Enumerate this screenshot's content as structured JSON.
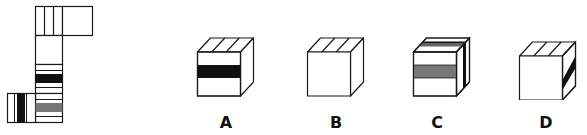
{
  "puzzle": {
    "type": "cube-net-folding",
    "net": {
      "faces": [
        {
          "id": "top-left",
          "pattern": "three-vertical-stripes"
        },
        {
          "id": "top-right",
          "pattern": "blank"
        },
        {
          "id": "middle-1",
          "pattern": "blank"
        },
        {
          "id": "middle-2",
          "pattern": "black-horizontal-band"
        },
        {
          "id": "bottom",
          "pattern": "gray-horizontal-band"
        },
        {
          "id": "bottom-left",
          "pattern": "black-vertical-band"
        }
      ]
    },
    "options": [
      {
        "label": "A",
        "front": "black-horizontal-band",
        "top": "three-stripes",
        "right": "blank"
      },
      {
        "label": "B",
        "front": "blank",
        "top": "three-stripes",
        "right": "blank"
      },
      {
        "label": "C",
        "front": "gray-horizontal-band",
        "top": "black-and-gray-stripes",
        "right": "black-vertical-band"
      },
      {
        "label": "D",
        "front": "blank",
        "top": "three-stripes",
        "right": "black-diagonal-band"
      }
    ]
  },
  "colors": {
    "stroke": "#1a1a1a",
    "black": "#111111",
    "gray": "#777777",
    "white": "#ffffff"
  }
}
